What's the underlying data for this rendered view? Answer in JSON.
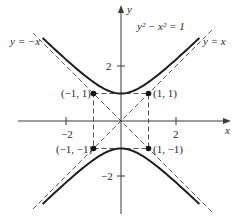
{
  "diagram": {
    "equation_label": "y² − x² = 1",
    "asymptote_left_label": "y = −x",
    "asymptote_right_label": "y = x",
    "x_axis_label": "x",
    "y_axis_label": "y",
    "x_ticks": [
      {
        "value": -2,
        "label": "−2"
      },
      {
        "value": 2,
        "label": "2"
      }
    ],
    "y_ticks": [
      {
        "value": 2,
        "label": "2"
      },
      {
        "value": -2,
        "label": "−2"
      }
    ],
    "points": [
      {
        "x": -1,
        "y": 1,
        "label": "(−1, 1)"
      },
      {
        "x": 1,
        "y": 1,
        "label": "(1, 1)"
      },
      {
        "x": -1,
        "y": -1,
        "label": "(−1, −1)"
      },
      {
        "x": 1,
        "y": -1,
        "label": "(1, −1)"
      }
    ],
    "colors": {
      "curve": "#1e1e1e",
      "dashed": "#555555",
      "axes": "#3a3a3a"
    }
  }
}
